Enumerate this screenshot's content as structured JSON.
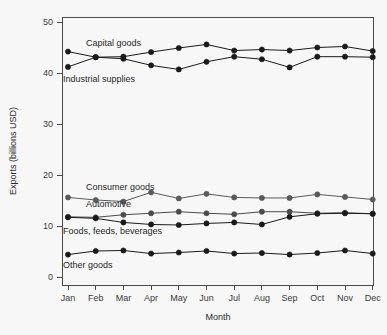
{
  "chart_data": {
    "type": "line",
    "title": "",
    "xlabel": "Month",
    "ylabel": "Exports (billions USD)",
    "categories": [
      "Jan",
      "Feb",
      "Mar",
      "Apr",
      "May",
      "Jun",
      "Jul",
      "Aug",
      "Sep",
      "Oct",
      "Nov",
      "Dec"
    ],
    "x_tick_labels": [
      "Jan",
      "Feb",
      "Mar",
      "Apr",
      "May",
      "Jun",
      "Jul",
      "Aug",
      "Sep",
      "Oct",
      "Nov",
      "Dec"
    ],
    "y_tick_labels": [
      "0",
      "10",
      "20",
      "30",
      "40",
      "50"
    ],
    "y_ticks": [
      0,
      10,
      20,
      30,
      40,
      50
    ],
    "ylim": [
      0,
      50
    ],
    "grid": false,
    "legend_position": "inline-labels",
    "series": [
      {
        "name": "Capital goods",
        "color": "#1a1a1a",
        "marker": "filled-circle",
        "values": [
          44.2,
          43.1,
          43.2,
          44.1,
          44.9,
          45.6,
          44.4,
          44.6,
          44.4,
          45.0,
          45.2,
          44.3
        ]
      },
      {
        "name": "Industrial supplies",
        "color": "#1a1a1a",
        "marker": "filled-circle",
        "values": [
          41.2,
          43.1,
          42.8,
          41.5,
          40.7,
          42.2,
          43.2,
          42.7,
          41.1,
          43.2,
          43.2,
          43.1
        ]
      },
      {
        "name": "Consumer goods",
        "color": "#5a5a5a",
        "marker": "filled-circle",
        "values": [
          15.6,
          15.1,
          14.8,
          16.6,
          15.4,
          16.3,
          15.6,
          15.5,
          15.5,
          16.2,
          15.7,
          15.2
        ]
      },
      {
        "name": "Automotive",
        "color": "#4a4a4a",
        "marker": "filled-circle",
        "values": [
          11.8,
          11.7,
          12.2,
          12.5,
          12.8,
          12.5,
          12.3,
          12.8,
          12.8,
          12.5,
          12.6,
          12.4
        ]
      },
      {
        "name": "Foods, feeds, beverages",
        "color": "#1a1a1a",
        "marker": "filled-circle",
        "values": [
          11.7,
          11.5,
          10.7,
          10.3,
          10.2,
          10.5,
          10.7,
          10.3,
          11.8,
          12.4,
          12.5,
          12.4
        ]
      },
      {
        "name": "Other goods",
        "color": "#1a1a1a",
        "marker": "filled-circle",
        "values": [
          4.4,
          5.1,
          5.2,
          4.6,
          4.8,
          5.1,
          4.6,
          4.7,
          4.4,
          4.7,
          5.2,
          4.6
        ]
      }
    ],
    "series_labels": [
      {
        "text": "Capital goods",
        "x": 86,
        "y": 46
      },
      {
        "text": "Industrial supplies",
        "x": 63,
        "y": 82
      },
      {
        "text": "Consumer goods",
        "x": 86,
        "y": 190
      },
      {
        "text": "Automotive",
        "x": 86,
        "y": 207
      },
      {
        "text": "Foods, feeds, beverages",
        "x": 63,
        "y": 234
      },
      {
        "text": "Other goods",
        "x": 63,
        "y": 268
      }
    ]
  }
}
